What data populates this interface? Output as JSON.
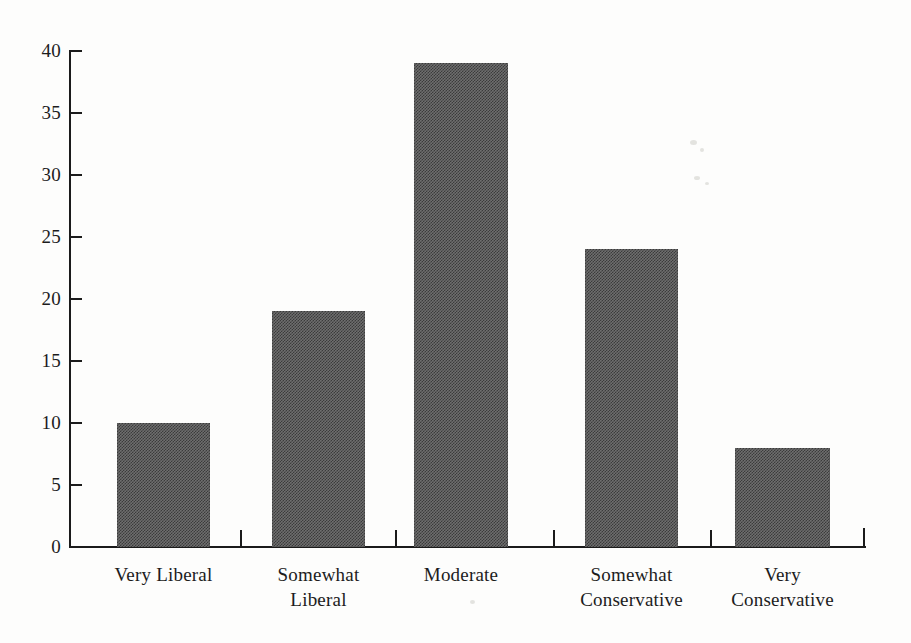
{
  "chart_data": {
    "type": "bar",
    "title": "",
    "xlabel": "",
    "ylabel": "",
    "categories": [
      "Very Liberal",
      "Somewhat Liberal",
      "Moderate",
      "Somewhat Conservative",
      "Very Conservative"
    ],
    "category_lines": [
      [
        "Very Liberal"
      ],
      [
        "Somewhat",
        "Liberal"
      ],
      [
        "Moderate"
      ],
      [
        "Somewhat",
        "Conservative"
      ],
      [
        "Very",
        "Conservative"
      ]
    ],
    "values": [
      10,
      19,
      39,
      24,
      8
    ],
    "ylim": [
      0,
      40
    ],
    "yticks": [
      0,
      5,
      10,
      15,
      20,
      25,
      30,
      35,
      40
    ],
    "ytick_labels": [
      "0",
      "5",
      "10",
      "15",
      "20",
      "25",
      "30",
      "35",
      "40"
    ],
    "grid": false,
    "legend": null,
    "bar_color": "#6e6e6e",
    "axis_color": "#1b1b1b",
    "background_color": "#fdfdfc"
  },
  "chart": {
    "bars": [
      {
        "label": "Very Liberal",
        "value": 10,
        "left": 117,
        "width": 93
      },
      {
        "label": "Somewhat Liberal",
        "value": 19,
        "left": 272,
        "width": 93
      },
      {
        "label": "Moderate",
        "value": 39,
        "left": 414,
        "width": 94
      },
      {
        "label": "Somewhat Conservative",
        "value": 24,
        "left": 585,
        "width": 93
      },
      {
        "label": "Very Conservative",
        "value": 8,
        "left": 735,
        "width": 95
      }
    ],
    "x_separator_ticks": [
      240,
      395,
      553,
      710
    ],
    "y_axis_label_positions": [
      0,
      5,
      10,
      15,
      20,
      25,
      30,
      35,
      40
    ]
  }
}
